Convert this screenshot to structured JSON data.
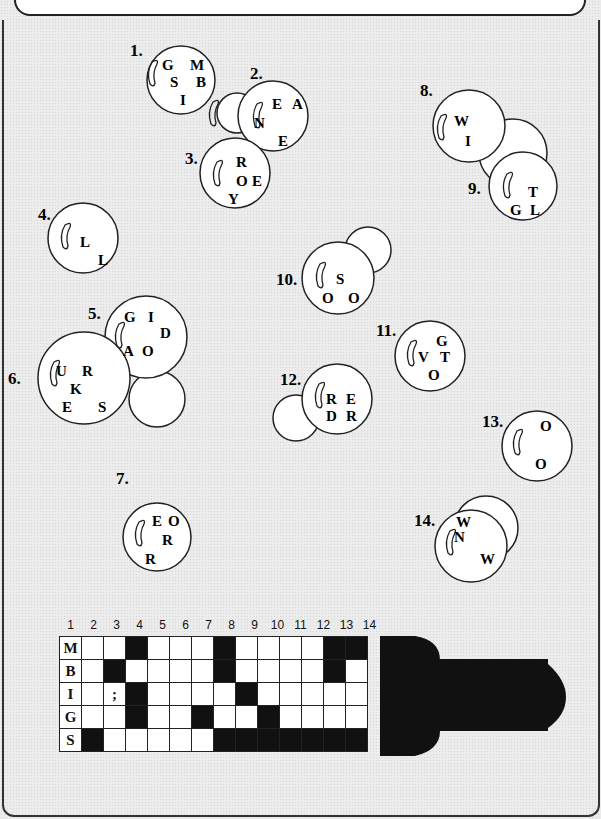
{
  "header": {
    "text": "below. Bessie h?gets into column 1, ..."
  },
  "bubbles": [
    {
      "num": "1.",
      "letters": [
        "G",
        "M",
        "S",
        "B",
        "I"
      ]
    },
    {
      "num": "2.",
      "letters": [
        "E",
        "A",
        "N",
        "E"
      ]
    },
    {
      "num": "3.",
      "letters": [
        "R",
        "O",
        "E",
        "Y"
      ]
    },
    {
      "num": "4.",
      "letters": [
        "L",
        "L"
      ]
    },
    {
      "num": "5.",
      "letters": [
        "G",
        "I",
        "D",
        "A",
        "O"
      ]
    },
    {
      "num": "6.",
      "letters": [
        "U",
        "R",
        "K",
        "E",
        "S"
      ]
    },
    {
      "num": "7.",
      "letters": [
        "E",
        "O",
        "R",
        "R"
      ]
    },
    {
      "num": "8.",
      "letters": [
        "W",
        "I"
      ]
    },
    {
      "num": "9.",
      "letters": [
        "T",
        "G",
        "L"
      ]
    },
    {
      "num": "10.",
      "letters": [
        "S",
        "O",
        "O"
      ]
    },
    {
      "num": "11.",
      "letters": [
        "G",
        "V",
        "T",
        "O"
      ]
    },
    {
      "num": "12.",
      "letters": [
        "R",
        "E",
        "D",
        "R"
      ]
    },
    {
      "num": "13.",
      "letters": [
        "O",
        "O"
      ]
    },
    {
      "num": "14.",
      "letters": [
        "W",
        "N",
        "W"
      ]
    }
  ],
  "grid": {
    "column_numbers": [
      "1",
      "2",
      "3",
      "4",
      "5",
      "6",
      "7",
      "8",
      "9",
      "10",
      "11",
      "12",
      "13",
      "14"
    ],
    "rows": [
      {
        "label": "M",
        "cells": [
          "",
          "",
          "#",
          "",
          "",
          "",
          "#",
          "",
          "",
          "",
          "",
          "#",
          "#"
        ]
      },
      {
        "label": "B",
        "cells": [
          "",
          "#",
          "",
          "",
          "",
          "",
          "#",
          "",
          "",
          "",
          "",
          "#",
          ""
        ]
      },
      {
        "label": "I",
        "cells": [
          "",
          ";",
          "#",
          "",
          "",
          "",
          "",
          "#",
          "",
          "",
          "",
          "",
          ""
        ]
      },
      {
        "label": "G",
        "cells": [
          "",
          "",
          "#",
          "",
          "",
          "#",
          "",
          "",
          "#",
          "",
          "",
          "",
          ""
        ]
      },
      {
        "label": "S",
        "cells": [
          "#",
          "",
          "",
          "",
          "",
          "",
          "#",
          "#",
          "#",
          "#",
          "#",
          "#",
          "#"
        ]
      }
    ]
  }
}
